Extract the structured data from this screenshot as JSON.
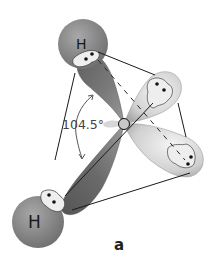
{
  "figure": {
    "caption": "a",
    "molecule": "water",
    "angle_label": "104.5°",
    "atoms": [
      {
        "symbol": "H",
        "position": "top"
      },
      {
        "symbol": "H",
        "position": "bottom-left"
      },
      {
        "symbol": "O",
        "position": "center",
        "label_shown": false
      }
    ],
    "orbitals": [
      {
        "type": "bonding",
        "to": "top H"
      },
      {
        "type": "bonding",
        "to": "bottom H"
      },
      {
        "type": "lone-pair",
        "position": "upper-right"
      },
      {
        "type": "lone-pair",
        "position": "lower-right"
      }
    ],
    "colors": {
      "hydrogen": "#8a8a8a",
      "bonding_lobe": "#7a7a7a",
      "lone_pair_lobe": "#d8d8d8",
      "electron_pocket": "#f2f2f2",
      "edge_lines": "#1a1a1a"
    }
  }
}
